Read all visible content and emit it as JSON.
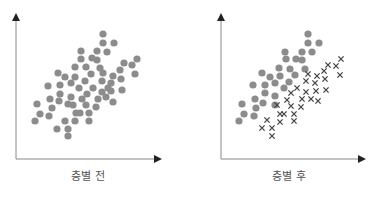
{
  "panels": [
    {
      "label": "층별 전",
      "dot_color": "#8c8c8c",
      "dots": [
        [
          103,
          34
        ],
        [
          103,
          43
        ],
        [
          114,
          43
        ],
        [
          81,
          51
        ],
        [
          97,
          51
        ],
        [
          107,
          52
        ],
        [
          81,
          59
        ],
        [
          92,
          58
        ],
        [
          97,
          60
        ],
        [
          124,
          63
        ],
        [
          137,
          59
        ],
        [
          132,
          65
        ],
        [
          75,
          67
        ],
        [
          86,
          67
        ],
        [
          100,
          68
        ],
        [
          120,
          70
        ],
        [
          58,
          73
        ],
        [
          103,
          73
        ],
        [
          135,
          74
        ],
        [
          65,
          77
        ],
        [
          75,
          77
        ],
        [
          91,
          74
        ],
        [
          113,
          76
        ],
        [
          121,
          79
        ],
        [
          48,
          86
        ],
        [
          60,
          85
        ],
        [
          71,
          83
        ],
        [
          85,
          81
        ],
        [
          102,
          81
        ],
        [
          111,
          83
        ],
        [
          79,
          88
        ],
        [
          93,
          88
        ],
        [
          108,
          88
        ],
        [
          122,
          90
        ],
        [
          60,
          94
        ],
        [
          87,
          94
        ],
        [
          102,
          92
        ],
        [
          111,
          91
        ],
        [
          50,
          99
        ],
        [
          71,
          97
        ],
        [
          82,
          99
        ],
        [
          98,
          99
        ],
        [
          106,
          97
        ],
        [
          59,
          101
        ],
        [
          113,
          102
        ],
        [
          37,
          104
        ],
        [
          52,
          108
        ],
        [
          68,
          104
        ],
        [
          73,
          105
        ],
        [
          86,
          105
        ],
        [
          96,
          107
        ],
        [
          40,
          114
        ],
        [
          49,
          116
        ],
        [
          76,
          113
        ],
        [
          80,
          113
        ],
        [
          89,
          113
        ],
        [
          35,
          121
        ],
        [
          65,
          121
        ],
        [
          75,
          121
        ],
        [
          89,
          121
        ],
        [
          57,
          129
        ],
        [
          68,
          129
        ],
        [
          68,
          136
        ]
      ],
      "crosses": []
    },
    {
      "label": "층별 후",
      "dot_color": "#8c8c8c",
      "cross_color": "#444444",
      "dots": [
        [
          308,
          34
        ],
        [
          308,
          43
        ],
        [
          319,
          43
        ],
        [
          285,
          52
        ],
        [
          302,
          52
        ],
        [
          312,
          52
        ],
        [
          286,
          59
        ],
        [
          296,
          59
        ],
        [
          302,
          60
        ],
        [
          262,
          73
        ],
        [
          279,
          68
        ],
        [
          290,
          69
        ],
        [
          305,
          69
        ],
        [
          270,
          77
        ],
        [
          280,
          76
        ],
        [
          295,
          75
        ],
        [
          253,
          85
        ],
        [
          265,
          85
        ],
        [
          275,
          83
        ],
        [
          289,
          82
        ],
        [
          265,
          93
        ],
        [
          284,
          88
        ],
        [
          255,
          99
        ],
        [
          275,
          96
        ],
        [
          242,
          104
        ],
        [
          263,
          103
        ],
        [
          256,
          108
        ],
        [
          275,
          105
        ],
        [
          244,
          114
        ],
        [
          254,
          116
        ],
        [
          239,
          121
        ]
      ],
      "crosses": [
        [
          341,
          59
        ],
        [
          328,
          65
        ],
        [
          336,
          66
        ],
        [
          324,
          71
        ],
        [
          308,
          74
        ],
        [
          317,
          76
        ],
        [
          340,
          75
        ],
        [
          306,
          81
        ],
        [
          315,
          83
        ],
        [
          325,
          79
        ],
        [
          297,
          88
        ],
        [
          291,
          93
        ],
        [
          306,
          92
        ],
        [
          316,
          91
        ],
        [
          326,
          90
        ],
        [
          302,
          99
        ],
        [
          311,
          99
        ],
        [
          318,
          101
        ],
        [
          287,
          100
        ],
        [
          277,
          105
        ],
        [
          291,
          106
        ],
        [
          301,
          107
        ],
        [
          280,
          114
        ],
        [
          284,
          114
        ],
        [
          294,
          114
        ],
        [
          267,
          120
        ],
        [
          280,
          122
        ],
        [
          294,
          121
        ],
        [
          262,
          128
        ],
        [
          272,
          128
        ],
        [
          272,
          136
        ]
      ]
    }
  ]
}
